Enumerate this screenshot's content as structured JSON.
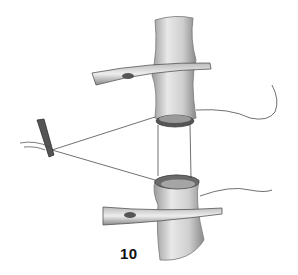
{
  "figure": {
    "label": "10",
    "colors": {
      "background": "#ffffff",
      "vessel_light": "#e6e6e6",
      "vessel_mid": "#bdbdbd",
      "vessel_dark": "#7a7a7a",
      "line": "#333333"
    }
  }
}
